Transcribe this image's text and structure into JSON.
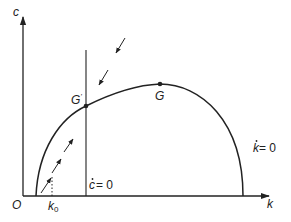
{
  "diagram": {
    "type": "phase-diagram",
    "axes": {
      "y_label": "c",
      "x_label": "k",
      "origin_label": "O"
    },
    "markers": {
      "k0_label": "k",
      "k0_subscript": "0"
    },
    "curves": {
      "k_dot_zero": {
        "label_var": "k",
        "label_eq": " = 0",
        "shape": "inverted-U"
      },
      "c_dot_zero": {
        "label_var": "c",
        "label_eq": " = 0",
        "shape": "vertical line"
      }
    },
    "points": [
      {
        "name": "G'",
        "label": "G",
        "prime": "'",
        "description": "intersection of c-dot=0 and k-dot=0"
      },
      {
        "name": "G",
        "label": "G",
        "description": "peak of k-dot=0 curve (golden rule)"
      }
    ],
    "arrows": {
      "below_curve": 3,
      "above_curve": 2
    },
    "colors": {
      "line": "#222222",
      "background": "#ffffff"
    }
  }
}
